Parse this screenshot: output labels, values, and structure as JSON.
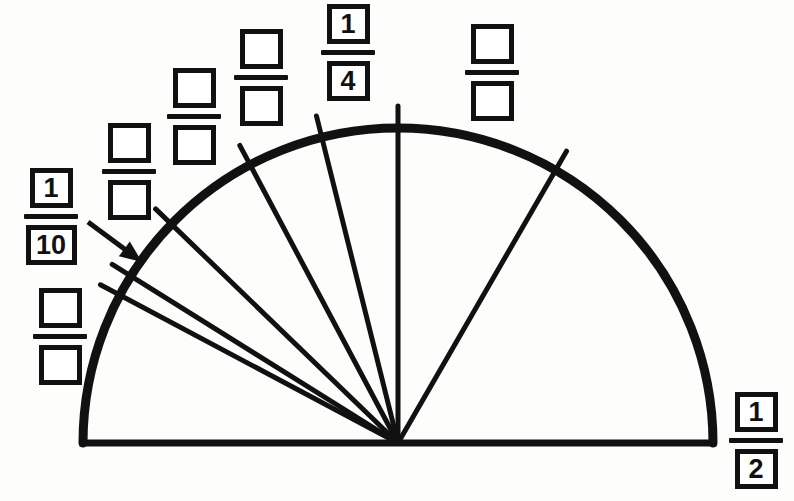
{
  "page": {
    "width": 794,
    "height": 501,
    "background_color": "#fdfdfb",
    "ink_color": "#111111"
  },
  "figure": {
    "type": "semicircle-sector-diagram",
    "center": {
      "x": 398,
      "y": 443
    },
    "radius": 315,
    "baseline": {
      "x1": 83,
      "y1": 443,
      "x2": 713,
      "y2": 443
    },
    "arc_stroke_width": 9,
    "baseline_stroke_width": 7,
    "radius_stroke_width": 5,
    "arc_top": {
      "x": 398,
      "y": 113
    },
    "radii": [
      {
        "name": "radius-1-10-upper",
        "angle_deg": 152.0,
        "crosses_arc_at": {
          "x": 120,
          "y": 295
        }
      },
      {
        "name": "radius-1-10-lower",
        "angle_deg": 148.0,
        "crosses_arc_at": {
          "x": 131,
          "y": 276
        }
      },
      {
        "name": "radius-third",
        "angle_deg": 136.0,
        "crosses_arc_at": {
          "x": 171,
          "y": 224
        }
      },
      {
        "name": "radius-fourth",
        "angle_deg": 118.0,
        "crosses_arc_at": {
          "x": 250,
          "y": 165
        }
      },
      {
        "name": "radius-fifth",
        "angle_deg": 104.0,
        "crosses_arc_at": {
          "x": 322,
          "y": 137
        }
      },
      {
        "name": "radius-vertical",
        "angle_deg": 90.0,
        "crosses_arc_at": {
          "x": 398,
          "y": 128
        }
      },
      {
        "name": "radius-half",
        "angle_deg": 60.0,
        "crosses_arc_at": {
          "x": 555,
          "y": 170
        }
      }
    ],
    "tick_overshoot": 22
  },
  "arrow": {
    "name": "callout-arrow",
    "from": {
      "x": 88,
      "y": 222
    },
    "to": {
      "x": 142,
      "y": 262
    },
    "stroke_width": 5,
    "head_length": 22
  },
  "fractions": [
    {
      "id": "frac-1-10",
      "numerator": "1",
      "denominator": "10",
      "filled": true,
      "size": "std",
      "wide_denominator": true,
      "left": 24,
      "top": 168
    },
    {
      "id": "frac-blank-left-lower",
      "numerator": "",
      "denominator": "",
      "filled": false,
      "size": "std",
      "wide_denominator": false,
      "left": 33,
      "top": 288
    },
    {
      "id": "frac-blank-a",
      "numerator": "",
      "denominator": "",
      "filled": false,
      "size": "std",
      "wide_denominator": false,
      "left": 102,
      "top": 123
    },
    {
      "id": "frac-blank-b",
      "numerator": "",
      "denominator": "",
      "filled": false,
      "size": "std",
      "wide_denominator": false,
      "left": 167,
      "top": 68
    },
    {
      "id": "frac-blank-c",
      "numerator": "",
      "denominator": "",
      "filled": false,
      "size": "std",
      "wide_denominator": false,
      "left": 234,
      "top": 29
    },
    {
      "id": "frac-1-4",
      "numerator": "1",
      "denominator": "4",
      "filled": true,
      "size": "std",
      "wide_denominator": false,
      "left": 321,
      "top": 4
    },
    {
      "id": "frac-blank-d",
      "numerator": "",
      "denominator": "",
      "filled": false,
      "size": "std",
      "wide_denominator": false,
      "left": 465,
      "top": 24
    },
    {
      "id": "frac-1-2",
      "numerator": "1",
      "denominator": "2",
      "filled": true,
      "size": "std",
      "wide_denominator": false,
      "left": 729,
      "top": 392
    }
  ]
}
